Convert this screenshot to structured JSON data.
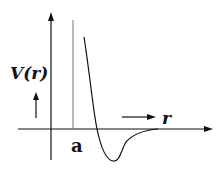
{
  "diagram": {
    "title": "",
    "labels": {
      "y_axis": "V(r)",
      "x_axis": "r",
      "marker": "a"
    },
    "colors": {
      "line": "#111111",
      "marker_line": "#777777",
      "background": "#ffffff"
    }
  }
}
